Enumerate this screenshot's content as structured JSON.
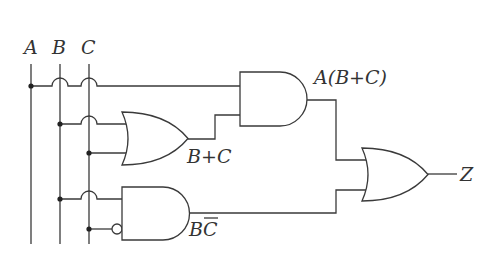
{
  "diagram": {
    "type": "logic-circuit",
    "inputs": [
      {
        "label": "A"
      },
      {
        "label": "B"
      },
      {
        "label": "C"
      }
    ],
    "gates": [
      {
        "id": "and1",
        "kind": "AND",
        "label": "A(B+C)"
      },
      {
        "id": "or1",
        "kind": "OR",
        "label": "B+C"
      },
      {
        "id": "and2",
        "kind": "AND",
        "label": "BC̄",
        "label_base": "BC",
        "overline": "C"
      },
      {
        "id": "or2",
        "kind": "OR"
      }
    ],
    "output": {
      "label": "Z"
    },
    "labels": {
      "a": "A",
      "b": "B",
      "c": "C",
      "and1_out": "A(B+C)",
      "or1_out": "B+C",
      "and2_out_b": "B",
      "and2_out_c": "C",
      "z": "Z",
      "z_dash": "–"
    },
    "colors": {
      "line": "#3a3a3a",
      "background": "#ffffff"
    }
  }
}
